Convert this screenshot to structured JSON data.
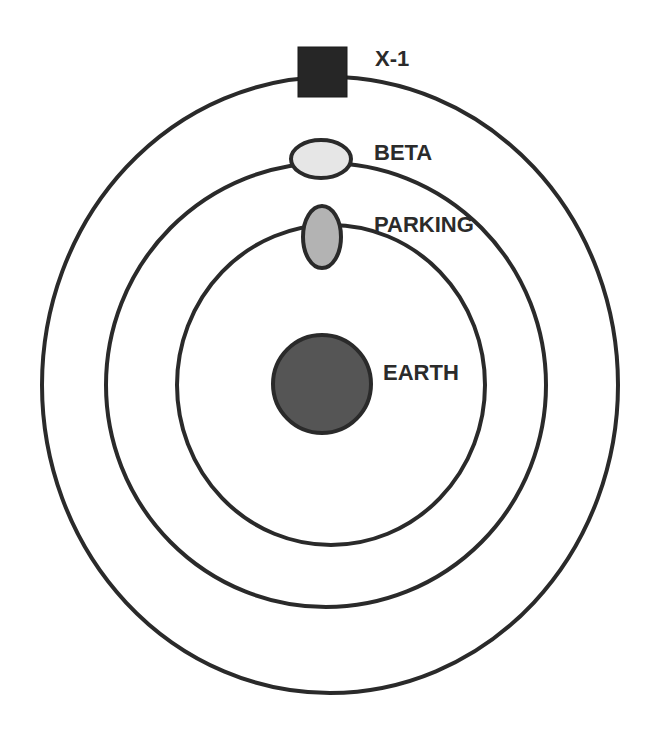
{
  "diagram": {
    "type": "concentric-orbits",
    "center": {
      "x": 330,
      "y": 385
    },
    "stroke_color": "#2a2a2a",
    "orbits": [
      {
        "name": "outer-orbit",
        "rx": 288,
        "ry": 308
      },
      {
        "name": "middle-orbit",
        "rx": 220,
        "ry": 222
      },
      {
        "name": "inner-orbit",
        "rx": 154,
        "ry": 160
      }
    ],
    "bodies": [
      {
        "id": "earth",
        "label": "EARTH",
        "shape": "circle",
        "fill": "#555555"
      },
      {
        "id": "parking",
        "label": "PARKING",
        "shape": "ellipse-vertical",
        "fill": "#b3b3b3"
      },
      {
        "id": "beta",
        "label": "BETA",
        "shape": "ellipse-horizontal",
        "fill": "#e6e6e6"
      },
      {
        "id": "x1",
        "label": "X-1",
        "shape": "square",
        "fill": "#262626"
      }
    ]
  }
}
